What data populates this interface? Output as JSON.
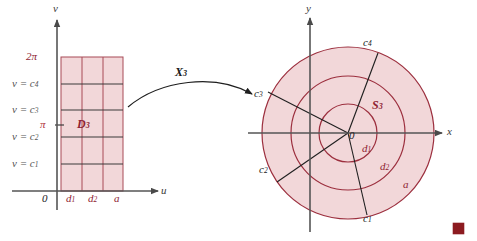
{
  "figure": {
    "colors": {
      "region_fill": "#f2d7d9",
      "grid_red": "#a03848",
      "curve_red": "#9c2f3e",
      "axis_gray": "#555555",
      "label_red": "#8f2533",
      "label_dark": "#1a1a1a",
      "marker_red": "#8c1b20"
    }
  },
  "left_plot": {
    "name": "uv-domain",
    "axis_x_label": "u",
    "axis_y_label": "v",
    "origin_label": "0",
    "region_label": "D",
    "region_sub": "3",
    "y_ticks": [
      {
        "label": "2π",
        "sub": "",
        "style": "plain"
      },
      {
        "label": "v = c",
        "sub": "4",
        "style": "eq"
      },
      {
        "label": "v = c",
        "sub": "3",
        "style": "eq"
      },
      {
        "label": "π",
        "sub": "",
        "style": "plain"
      },
      {
        "label": "v = c",
        "sub": "2",
        "style": "eq"
      },
      {
        "label": "v = c",
        "sub": "1",
        "style": "eq"
      }
    ],
    "x_ticks": [
      {
        "label": "d",
        "sub": "1"
      },
      {
        "label": "d",
        "sub": "2"
      },
      {
        "label": "a",
        "sub": ""
      }
    ]
  },
  "arrow": {
    "name": "map-arrow",
    "label": "X",
    "label_sub": "3"
  },
  "right_plot": {
    "name": "xy-image",
    "axis_x_label": "x",
    "axis_y_label": "y",
    "origin_label": "0",
    "region_label": "S",
    "region_sub": "3",
    "circle_labels": [
      {
        "label": "d",
        "sub": "1"
      },
      {
        "label": "d",
        "sub": "2"
      },
      {
        "label": "a",
        "sub": ""
      }
    ],
    "ray_labels": [
      {
        "label": "c",
        "sub": "1"
      },
      {
        "label": "c",
        "sub": "2"
      },
      {
        "label": "c",
        "sub": "3"
      },
      {
        "label": "c",
        "sub": "4"
      }
    ]
  },
  "marker": {
    "name": "page-marker",
    "shape": "filled-square"
  }
}
